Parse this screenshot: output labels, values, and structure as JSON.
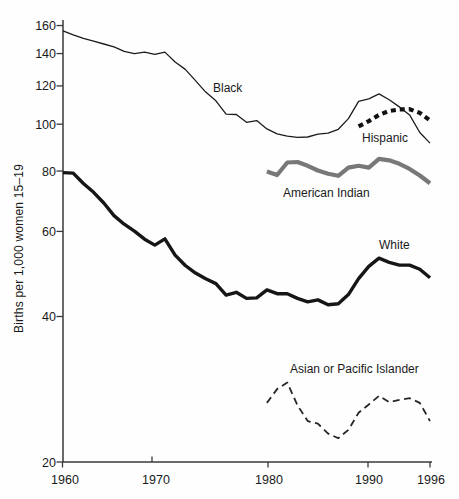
{
  "page": {
    "background": "#fefefe"
  },
  "chart_data": {
    "type": "line",
    "title": "",
    "xlabel": "",
    "ylabel": "Births per 1,000 women 15–19",
    "y_scale": "log",
    "xlim": [
      1960,
      1996
    ],
    "ylim": [
      20,
      160
    ],
    "grid": false,
    "legend": "inline-labels",
    "axis_color": "#3a3a3a",
    "y_ticks": [
      160,
      140,
      120,
      100,
      80,
      60,
      40,
      20
    ],
    "x_ticks": [
      1960,
      1970,
      1980,
      1990,
      1996
    ],
    "series": [
      {
        "name": "Black",
        "color": "#1c1c1c",
        "style": "thin",
        "start_year": 1960,
        "values": [
          156,
          153,
          150.5,
          148.5,
          146.5,
          144.5,
          141.5,
          140,
          141,
          139.5,
          141,
          134.5,
          129.8,
          123.1,
          116.5,
          111.8,
          104.9,
          104.7,
          100.9,
          101.7,
          97.8,
          95.5,
          94.5,
          93.9,
          94.1,
          95.4,
          95.8,
          97.6,
          102.7,
          111.5,
          112.8,
          115.5,
          112.4,
          108.6,
          104.5,
          96.1,
          91.4
        ],
        "label": {
          "text": "Black",
          "x": 213,
          "y": 92
        }
      },
      {
        "name": "White",
        "color": "#161616",
        "style": "thick",
        "start_year": 1960,
        "values": [
          79.4,
          79.2,
          75.4,
          72.3,
          68.7,
          64.7,
          62.1,
          60.1,
          57.8,
          56.2,
          57.9,
          53.6,
          51.0,
          49.2,
          47.9,
          46.8,
          44.3,
          44.9,
          43.6,
          43.7,
          45.4,
          44.6,
          44.6,
          43.6,
          42.9,
          43.3,
          42.3,
          42.5,
          44.4,
          47.9,
          50.8,
          52.8,
          51.8,
          51.1,
          51.1,
          50.1,
          48.1
        ],
        "label": {
          "text": "White",
          "x": 379,
          "y": 249
        }
      },
      {
        "name": "Hispanic",
        "color": "#111111",
        "style": "thick-dashed",
        "start_year": 1989,
        "values": [
          99.0,
          101.5,
          104.5,
          106.5,
          107.3,
          107.4,
          105.5,
          101.8
        ],
        "label": {
          "text": "Hispanic",
          "x": 362,
          "y": 142
        }
      },
      {
        "name": "American Indian",
        "color": "#787878",
        "style": "gray-thick",
        "start_year": 1980,
        "values": [
          79.8,
          78.5,
          83.3,
          83.5,
          82.0,
          80.2,
          79.0,
          78.2,
          81.3,
          82.0,
          81.3,
          84.8,
          84.2,
          82.8,
          80.8,
          78.3,
          75.5
        ],
        "label": {
          "text": "American Indian",
          "x": 283,
          "y": 197
        }
      },
      {
        "name": "Asian or Pacific Islander",
        "color": "#262626",
        "style": "thin-dashed",
        "start_year": 1980,
        "values": [
          26.5,
          28.3,
          29.2,
          26.2,
          24.3,
          24.0,
          22.9,
          22.4,
          23.3,
          25.3,
          26.3,
          27.4,
          26.6,
          26.9,
          27.1,
          26.5,
          24.3
        ],
        "label": {
          "text": "Asian or Pacific Islander",
          "x": 290,
          "y": 373
        }
      }
    ]
  }
}
